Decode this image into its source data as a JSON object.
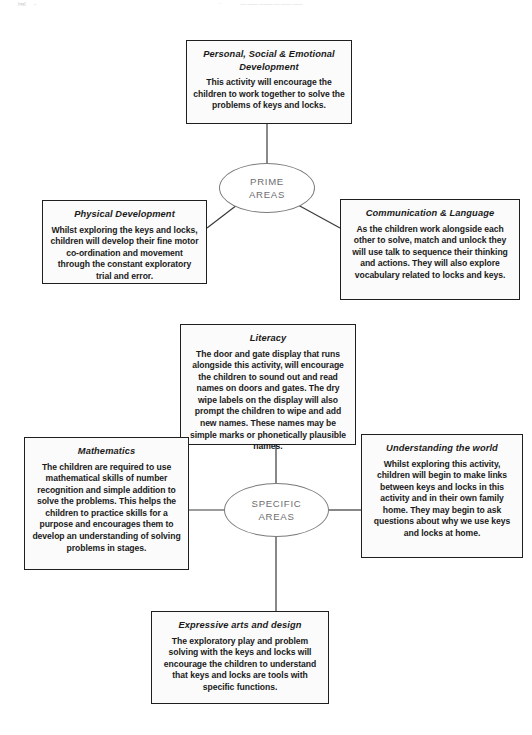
{
  "page": {
    "background": "#ffffff",
    "line_color": "#3a3a3a",
    "hub_color": "#6e6e6e",
    "box_border": "#1f1f1f",
    "box_fill": "#fbfbfb"
  },
  "header_artifacts": [
    {
      "text": "[spg]"
    },
    {
      "text": "→"
    },
    {
      "text": "···"
    },
    {
      "text": "——  ———  ————  ——  ———  ———"
    }
  ],
  "hubs": {
    "prime": {
      "line1": "PRIME",
      "line2": "AREAS"
    },
    "specific": {
      "line1": "SPECIFIC",
      "line2": "AREAS"
    }
  },
  "nodes": {
    "personal_social_emotional": {
      "title": "Personal, Social & Emotional Development",
      "body": "This activity will encourage the children to work together to solve the problems of keys and locks."
    },
    "physical_development": {
      "title": "Physical Development",
      "body": "Whilst exploring the keys and locks, children will develop their fine motor co-ordination and movement through the constant exploratory trial and error."
    },
    "communication_language": {
      "title": "Communication & Language",
      "body": "As the children work alongside each other to solve, match and unlock they will use talk to sequence their thinking and actions. They will also explore vocabulary related to locks and keys."
    },
    "literacy": {
      "title": "Literacy",
      "body": "The  door and gate display that runs alongside this activity, will encourage the children to sound out and read names on doors and gates. The dry wipe labels on the display will also prompt the children to wipe and add new names. These names may be simple marks or phonetically plausible names."
    },
    "mathematics": {
      "title": "Mathematics",
      "body": "The children are required to use mathematical skills of number recognition and simple addition to solve the problems. This helps the children to practice skills for a purpose and encourages them to develop an understanding of solving problems in stages."
    },
    "understanding_the_world": {
      "title": "Understanding the world",
      "body": "Whilst exploring this activity, children will begin to make links between keys and locks in this activity and in their own family home. They may begin to ask questions about why we use keys and locks at home."
    },
    "expressive_arts_design": {
      "title": "Expressive arts and design",
      "body": "The exploratory play and problem solving with the keys and locks will encourage the children to understand that keys and locks are tools with specific functions."
    }
  },
  "diagram_structure": {
    "type": "hub-and-spoke",
    "clusters": [
      {
        "hub": "PRIME AREAS",
        "spokes": [
          "Personal, Social & Emotional Development",
          "Physical Development",
          "Communication & Language"
        ]
      },
      {
        "hub": "SPECIFIC AREAS",
        "spokes": [
          "Literacy",
          "Mathematics",
          "Understanding the world",
          "Expressive arts and design"
        ]
      }
    ]
  }
}
